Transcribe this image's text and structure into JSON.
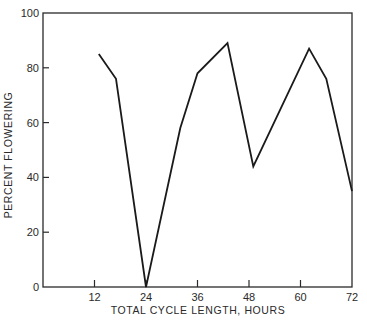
{
  "chart_data": {
    "type": "line",
    "title": "",
    "xlabel": "TOTAL CYCLE LENGTH, HOURS",
    "ylabel": "PERCENT FLOWERING",
    "xlim": [
      0,
      72
    ],
    "ylim": [
      0,
      100
    ],
    "x_ticks": [
      12,
      24,
      36,
      48,
      60,
      72
    ],
    "y_ticks": [
      0,
      20,
      40,
      60,
      80,
      100
    ],
    "grid": false,
    "legend": null,
    "frame": "box",
    "series": [
      {
        "name": "Percent flowering",
        "color": "#1a1a1a",
        "x": [
          13,
          17,
          24,
          32,
          36,
          43,
          49,
          62,
          66,
          72
        ],
        "y": [
          85,
          76,
          0,
          58,
          78,
          89,
          44,
          87,
          76,
          35
        ]
      }
    ]
  },
  "colors": {
    "line": "#1a1a1a",
    "axis": "#2a2a2a",
    "background": "#ffffff"
  }
}
